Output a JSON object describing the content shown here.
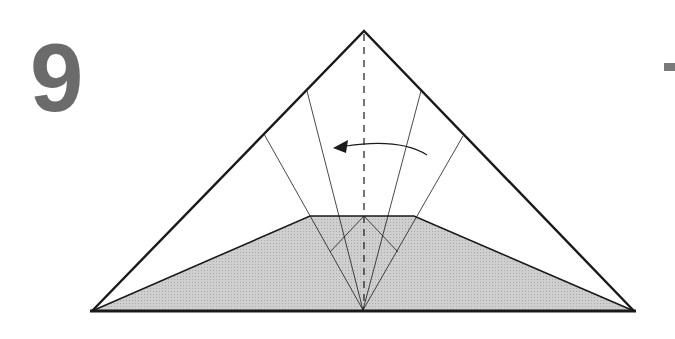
{
  "step": {
    "number": "9"
  },
  "diagram": {
    "colors": {
      "line": "#1a1a1a",
      "shade": "#c8c8c8",
      "number": "#6b6b6b"
    },
    "arrow": {
      "direction": "left"
    },
    "center_line": {
      "style": "dashed"
    }
  }
}
